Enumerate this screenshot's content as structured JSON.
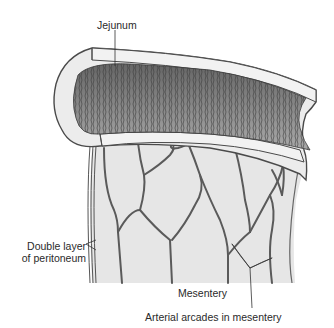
{
  "figure": {
    "labels": {
      "jejunum": "Jejunum",
      "double_layer_line1": "Double layer",
      "double_layer_line2": "of peritoneum",
      "mesentery": "Mesentery",
      "arterial_arcades": "Arterial arcades in mesentery"
    },
    "colors": {
      "background": "#ffffff",
      "wall": "#ececec",
      "mesentery": "#e6e6e6",
      "vessel": "#5a5a5a",
      "outline": "#4a4a4a",
      "mucosa_dark": "#6a6a6a",
      "mucosa_light": "#b8b8b8",
      "text": "#2a2a2a"
    }
  }
}
